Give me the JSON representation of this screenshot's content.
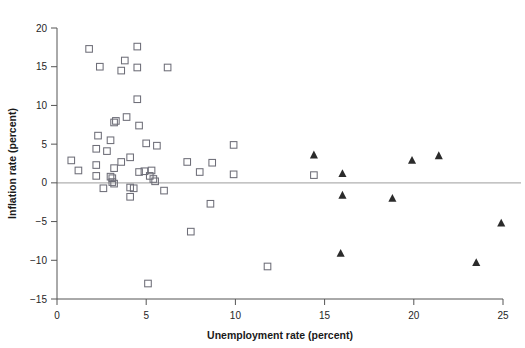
{
  "chart_data": {
    "type": "scatter",
    "title": "",
    "xlabel": "Unemployment rate (percent)",
    "ylabel": "Inflation rate (percent)",
    "xlim": [
      0,
      25
    ],
    "ylim": [
      -15,
      20
    ],
    "xticks": [
      0,
      5,
      10,
      15,
      20,
      25
    ],
    "yticks": [
      -15,
      -10,
      -5,
      0,
      5,
      10,
      15,
      20
    ],
    "xtick_labels": [
      "0",
      "5",
      "10",
      "15",
      "20",
      "25"
    ],
    "ytick_labels": [
      "−15",
      "−10",
      "−5",
      "0",
      "5",
      "10",
      "15",
      "20"
    ],
    "grid": false,
    "legend": "none",
    "reference_lines": [
      {
        "name": "zero-inflation-line",
        "orientation": "horizontal",
        "y": 0,
        "color": "#b0b0b0"
      }
    ],
    "series": [
      {
        "name": "open-square-series",
        "marker": "open-square",
        "color": "#6e6e78",
        "points": [
          [
            1.8,
            17.3
          ],
          [
            4.5,
            17.6
          ],
          [
            2.4,
            15.0
          ],
          [
            3.8,
            15.8
          ],
          [
            3.6,
            14.5
          ],
          [
            4.5,
            14.9
          ],
          [
            6.2,
            14.9
          ],
          [
            4.5,
            10.8
          ],
          [
            3.3,
            8.0
          ],
          [
            3.2,
            7.8
          ],
          [
            3.9,
            8.5
          ],
          [
            4.6,
            7.4
          ],
          [
            2.3,
            6.1
          ],
          [
            3.0,
            5.5
          ],
          [
            5.0,
            5.1
          ],
          [
            5.6,
            4.8
          ],
          [
            9.9,
            4.9
          ],
          [
            2.2,
            4.4
          ],
          [
            2.8,
            4.1
          ],
          [
            4.1,
            3.3
          ],
          [
            0.8,
            2.9
          ],
          [
            3.6,
            2.7
          ],
          [
            7.3,
            2.7
          ],
          [
            8.7,
            2.6
          ],
          [
            2.2,
            2.3
          ],
          [
            1.2,
            1.6
          ],
          [
            3.2,
            1.9
          ],
          [
            4.6,
            1.4
          ],
          [
            4.9,
            1.5
          ],
          [
            5.3,
            1.6
          ],
          [
            8.0,
            1.4
          ],
          [
            9.9,
            1.1
          ],
          [
            14.4,
            1.0
          ],
          [
            2.2,
            0.9
          ],
          [
            3.0,
            0.8
          ],
          [
            3.1,
            0.6
          ],
          [
            5.2,
            0.9
          ],
          [
            5.4,
            0.5
          ],
          [
            5.5,
            0.2
          ],
          [
            3.1,
            0.1
          ],
          [
            3.2,
            -0.1
          ],
          [
            2.6,
            -0.7
          ],
          [
            4.1,
            -0.6
          ],
          [
            4.3,
            -0.7
          ],
          [
            6.0,
            -1.0
          ],
          [
            4.1,
            -1.8
          ],
          [
            8.6,
            -2.7
          ],
          [
            7.5,
            -6.3
          ],
          [
            11.8,
            -10.8
          ],
          [
            5.1,
            -13.0
          ]
        ]
      },
      {
        "name": "filled-triangle-series",
        "marker": "filled-triangle",
        "color": "#2b2b2b",
        "points": [
          [
            14.4,
            3.6
          ],
          [
            19.9,
            2.9
          ],
          [
            21.4,
            3.5
          ],
          [
            16.0,
            1.2
          ],
          [
            16.0,
            -1.6
          ],
          [
            18.8,
            -2.0
          ],
          [
            24.9,
            -5.2
          ],
          [
            15.9,
            -9.1
          ],
          [
            23.5,
            -10.3
          ]
        ]
      }
    ]
  }
}
